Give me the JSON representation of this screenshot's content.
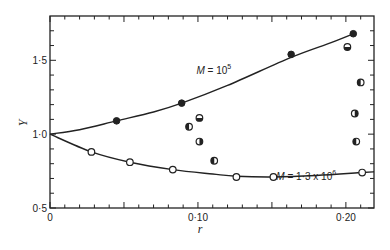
{
  "chart_data": {
    "type": "scatter",
    "title": "",
    "xlabel": "r",
    "ylabel": "Y",
    "xlim": [
      0,
      0.219
    ],
    "ylim": [
      0.5,
      1.8
    ],
    "x_ticks": [
      {
        "value": 0,
        "label": "0"
      },
      {
        "value": 0.1,
        "label": "0·10"
      },
      {
        "value": 0.2,
        "label": "0·20"
      }
    ],
    "y_ticks": [
      {
        "value": 0.5,
        "label": "0·5"
      },
      {
        "value": 1.0,
        "label": "1·0"
      },
      {
        "value": 1.5,
        "label": "1·5"
      }
    ],
    "grid": false,
    "legend": "none",
    "annotations": [
      {
        "text_main": "M = 10",
        "superscript": "5",
        "x": 0.099,
        "y": 1.41
      },
      {
        "text_main": "M = 1·3 x 10",
        "superscript": "6",
        "x": 0.153,
        "y": 0.69
      }
    ],
    "series": [
      {
        "name": "M = 10^5",
        "marker": "filled-circle",
        "points": [
          [
            0.045,
            1.09
          ],
          [
            0.089,
            1.21
          ],
          [
            0.163,
            1.54
          ],
          [
            0.205,
            1.68
          ]
        ],
        "fit_curve": [
          [
            0,
            1.0
          ],
          [
            0.02,
            1.03
          ],
          [
            0.045,
            1.09
          ],
          [
            0.07,
            1.15
          ],
          [
            0.089,
            1.21
          ],
          [
            0.12,
            1.33
          ],
          [
            0.163,
            1.52
          ],
          [
            0.19,
            1.62
          ],
          [
            0.205,
            1.68
          ]
        ]
      },
      {
        "name": "M = 1.3 x 10^6",
        "marker": "open-circle",
        "points": [
          [
            0.028,
            0.88
          ],
          [
            0.054,
            0.81
          ],
          [
            0.083,
            0.76
          ],
          [
            0.126,
            0.71
          ],
          [
            0.151,
            0.71
          ],
          [
            0.211,
            0.74
          ]
        ],
        "fit_curve": [
          [
            0,
            1.0
          ],
          [
            0.028,
            0.88
          ],
          [
            0.054,
            0.81
          ],
          [
            0.083,
            0.76
          ],
          [
            0.11,
            0.73
          ],
          [
            0.126,
            0.715
          ],
          [
            0.151,
            0.71
          ],
          [
            0.18,
            0.72
          ],
          [
            0.211,
            0.74
          ],
          [
            0.219,
            0.745
          ]
        ]
      },
      {
        "name": "intermediate",
        "marker": "half-filled-circle",
        "points": [
          [
            0.101,
            1.11
          ],
          [
            0.094,
            1.05
          ],
          [
            0.101,
            0.95
          ],
          [
            0.111,
            0.82
          ],
          [
            0.201,
            1.59
          ],
          [
            0.21,
            1.35
          ],
          [
            0.206,
            1.14
          ],
          [
            0.207,
            0.95
          ]
        ]
      }
    ]
  }
}
